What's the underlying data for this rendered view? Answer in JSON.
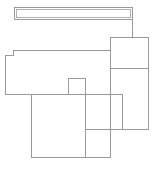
{
  "document": {
    "type": "line-drawing",
    "subject": "architectural floor plan outline",
    "canvas": {
      "width": 156,
      "height": 170
    },
    "background_color": "#ffffff",
    "line_color": "#9a9a9a",
    "line_color_light": "#b0b0b0",
    "line_width": 1,
    "has_text": false,
    "has_labels": false,
    "has_dimensions": false
  },
  "shapes": [
    {
      "name": "top-corridor-bar",
      "kind": "rectangle",
      "x": 14.5,
      "y": 7.5,
      "width": 118,
      "height": 12
    },
    {
      "name": "corridor-connector-line",
      "kind": "polyline",
      "points": "132.5,19.5 132.5,37.5"
    },
    {
      "name": "right-upper-room",
      "kind": "rectangle",
      "x": 110.5,
      "y": 37.5,
      "width": 38,
      "height": 31
    },
    {
      "name": "right-lower-room",
      "kind": "rectangle",
      "x": 110.5,
      "y": 68.5,
      "width": 38,
      "height": 61
    },
    {
      "name": "left-large-room",
      "kind": "polyline",
      "points": "110.5,50.5 13.5,50.5 13.5,55.5 5.5,55.5 5.5,94.5 110.5,94.5"
    },
    {
      "name": "small-alcove-notch",
      "kind": "polyline",
      "points": "68.5,94.5 68.5,78.5 85.5,78.5 85.5,94.5"
    },
    {
      "name": "center-room",
      "kind": "rectangle",
      "x": 85.5,
      "y": 94.5,
      "width": 37,
      "height": 35
    },
    {
      "name": "bottom-large-room",
      "kind": "rectangle",
      "x": 31.5,
      "y": 94.5,
      "width": 79,
      "height": 63
    },
    {
      "name": "bottom-room-divider",
      "kind": "polyline",
      "points": "85.5,129.5 85.5,157.5"
    },
    {
      "name": "right-room-bottom-edge",
      "kind": "polyline",
      "points": "122.5,129.5 148.5,129.5"
    }
  ]
}
